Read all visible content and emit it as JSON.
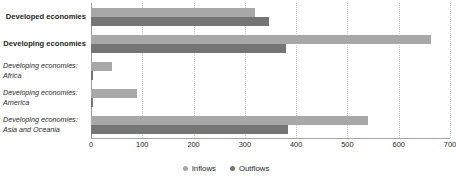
{
  "chart_data": {
    "type": "bar",
    "orientation": "horizontal",
    "title": "",
    "subtitle": "",
    "xlabel": "",
    "ylabel": "",
    "xlim": [
      0,
      700
    ],
    "xticks": [
      0,
      100,
      200,
      300,
      400,
      500,
      600,
      700
    ],
    "xtick_labels": [
      "0",
      "100",
      "200",
      "300",
      "400",
      "500",
      "600",
      "700"
    ],
    "grid": true,
    "grid_axis": "x",
    "legend_position": "bottom-center",
    "categories": [
      "Developed economies",
      "Developing economies",
      "Developing economies: Africa",
      "Developing economies: America",
      "Developing economies: Asia and Oceania"
    ],
    "category_styles": [
      "bold",
      "bold",
      "italic",
      "italic",
      "italic"
    ],
    "series": [
      {
        "name": "Inflows",
        "color": "#a8a8a8",
        "values": [
          320,
          662,
          40,
          90,
          540
        ]
      },
      {
        "name": "Outflows",
        "color": "#757575",
        "values": [
          348,
          380,
          4,
          4,
          385
        ]
      }
    ]
  },
  "categories": [
    {
      "line1": "Developed economies",
      "line2": ""
    },
    {
      "line1": "Developing economies",
      "line2": ""
    },
    {
      "line1": "Developing economies:",
      "line2": "Africa"
    },
    {
      "line1": "Developing economies:",
      "line2": "America"
    },
    {
      "line1": "Developing economies:",
      "line2": "Asia and Oceania"
    }
  ],
  "legend": [
    {
      "label": "Inflows",
      "color": "#a8a8a8"
    },
    {
      "label": "Outflows",
      "color": "#757575"
    }
  ],
  "colors": {
    "inflows": "#a8a8a8",
    "outflows": "#757575",
    "gridline": "#c9c9c9",
    "axis": "#9a9a9a",
    "text": "#231f20",
    "background": "#ffffff"
  }
}
